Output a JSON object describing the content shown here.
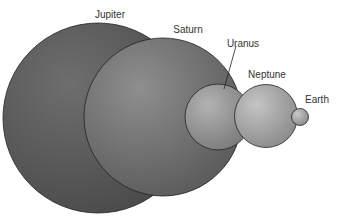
{
  "planets": [
    {
      "name": "Jupiter",
      "cx": 98,
      "cy": 118,
      "r": 95,
      "base": "#4a4a4a",
      "hi": "#6e6e6e",
      "label_x": 110,
      "label_y": 10
    },
    {
      "name": "Saturn",
      "cx": 163,
      "cy": 117,
      "r": 79,
      "base": "#5a5a5a",
      "hi": "#8e8e8e",
      "label_x": 188,
      "label_y": 25
    },
    {
      "name": "Uranus",
      "cx": 218,
      "cy": 117,
      "r": 33,
      "base": "#7a7a7a",
      "hi": "#b2b2b2",
      "label_x": 243,
      "label_y": 39
    },
    {
      "name": "Neptune",
      "cx": 266,
      "cy": 116,
      "r": 31.5,
      "base": "#8a8a8a",
      "hi": "#c4c4c4",
      "label_x": 267,
      "label_y": 70
    },
    {
      "name": "Earth",
      "cx": 300,
      "cy": 117,
      "r": 8.5,
      "base": "#8a8a8a",
      "hi": "#c8c8c8",
      "label_x": 317,
      "label_y": 95
    }
  ],
  "uranus_pointer": {
    "x1": 236,
    "y1": 46,
    "x2": 224,
    "y2": 89
  }
}
